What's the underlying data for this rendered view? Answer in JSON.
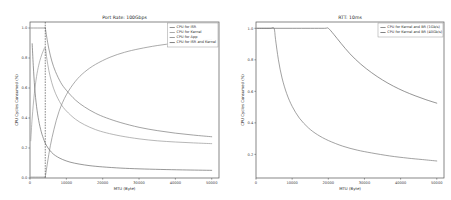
{
  "figure": {
    "background_color": "#ffffff",
    "width": 451,
    "height": 200
  },
  "chart_data": [
    {
      "id": "left",
      "type": "line",
      "title": "Port Rate: 100Gbps",
      "xlabel": "MTU (Byte)",
      "ylabel": "CPU Cycles Consumed (%)",
      "xlim": [
        0,
        52000
      ],
      "ylim": [
        0.0,
        1.04
      ],
      "xticks": [
        0,
        10000,
        20000,
        30000,
        40000,
        50000
      ],
      "xtick_labels": [
        "0",
        "10000",
        "20000",
        "30000",
        "40000",
        "50000"
      ],
      "yticks": [
        0.0,
        0.2,
        0.4,
        0.6,
        0.8,
        1.0
      ],
      "ytick_labels": [
        "0.0",
        "0.2",
        "0.4",
        "0.6",
        "0.8",
        "1.0"
      ],
      "grid": false,
      "legend_position": "upper right",
      "annotations": [
        {
          "kind": "vertical-dashed-line",
          "x": 4200,
          "label": ""
        }
      ],
      "series": [
        {
          "name": "CPU for ISR",
          "color": "#7f7f7f",
          "x": [
            200,
            1000,
            2000,
            3000,
            4000,
            4200,
            4600,
            5200,
            6000,
            7000,
            8500,
            10000,
            12500,
            15000,
            18000,
            21000,
            25000,
            30000,
            35000,
            40000,
            45000,
            50000
          ],
          "y": [
            1.0,
            1.0,
            1.0,
            1.0,
            1.0,
            1.0,
            0.94,
            0.86,
            0.78,
            0.71,
            0.635,
            0.585,
            0.52,
            0.474,
            0.432,
            0.401,
            0.369,
            0.338,
            0.316,
            0.299,
            0.286,
            0.275
          ]
        },
        {
          "name": "CPU for Kernel",
          "color": "#9a9a9a",
          "x": [
            200,
            600,
            1200,
            1800,
            2400,
            3000,
            3600,
            4200,
            4600,
            5200,
            6000,
            7000,
            8500,
            10000,
            12500,
            15000,
            18000,
            21000,
            25000,
            30000,
            35000,
            40000,
            45000,
            50000
          ],
          "y": [
            0.248,
            0.4,
            0.565,
            0.676,
            0.752,
            0.805,
            0.845,
            0.868,
            0.8,
            0.715,
            0.635,
            0.565,
            0.494,
            0.447,
            0.392,
            0.355,
            0.323,
            0.301,
            0.28,
            0.261,
            0.248,
            0.24,
            0.234,
            0.229
          ]
        },
        {
          "name": "CPU for App",
          "color": "#8a8a8a",
          "x": [
            200,
            1500,
            3000,
            4000,
            4200,
            4800,
            5600,
            6600,
            8000,
            10000,
            12500,
            15000,
            18000,
            22000,
            26000,
            30000,
            35000,
            40000,
            45000,
            50000
          ],
          "y": [
            0.006,
            0.006,
            0.006,
            0.006,
            0.008,
            0.1,
            0.215,
            0.325,
            0.445,
            0.555,
            0.645,
            0.706,
            0.757,
            0.805,
            0.838,
            0.861,
            0.883,
            0.899,
            0.912,
            0.923
          ]
        },
        {
          "name": "CPU for ISR and Kernel",
          "color": "#6f6f6f",
          "x": [
            600,
            900,
            1300,
            1800,
            2400,
            3100,
            3900,
            4600,
            5400,
            6400,
            7600,
            9000,
            11000,
            13500,
            16500,
            20000,
            25000,
            30000,
            36000,
            42000,
            50000
          ],
          "y": [
            0.895,
            0.75,
            0.6,
            0.478,
            0.383,
            0.308,
            0.25,
            0.214,
            0.186,
            0.16,
            0.14,
            0.123,
            0.106,
            0.093,
            0.082,
            0.074,
            0.066,
            0.061,
            0.057,
            0.054,
            0.051
          ]
        }
      ]
    },
    {
      "id": "right",
      "type": "line",
      "title": "RTT: 10ms",
      "xlabel": "MTU (Byte)",
      "ylabel": "CPU Cycles Consumed (%)",
      "xlim": [
        0,
        52000
      ],
      "ylim": [
        0.05,
        1.04
      ],
      "xticks": [
        0,
        10000,
        20000,
        30000,
        40000,
        50000
      ],
      "xtick_labels": [
        "0",
        "10000",
        "20000",
        "30000",
        "40000",
        "50000"
      ],
      "yticks": [
        0.2,
        0.4,
        0.6,
        0.8,
        1.0
      ],
      "ytick_labels": [
        "0.2",
        "0.4",
        "0.6",
        "0.8",
        "1.0"
      ],
      "grid": false,
      "legend_position": "upper right",
      "series": [
        {
          "name": "CPU for Kernel and BR (1Gb/s)",
          "color": "#7d7d7d",
          "x": [
            200,
            2000,
            4000,
            5000,
            5400,
            6200,
            7200,
            8500,
            10000,
            12000,
            14500,
            17000,
            20000,
            24000,
            28000,
            32000,
            37000,
            42000,
            46000,
            50000
          ],
          "y": [
            1.0,
            1.0,
            1.0,
            1.0,
            0.93,
            0.8,
            0.685,
            0.585,
            0.505,
            0.43,
            0.368,
            0.325,
            0.288,
            0.252,
            0.227,
            0.209,
            0.19,
            0.176,
            0.167,
            0.158
          ]
        },
        {
          "name": "CPU for Kernel and BR (40Gb/s)",
          "color": "#6b6b6b",
          "x": [
            200,
            5000,
            10000,
            15000,
            19000,
            20000,
            21500,
            23500,
            26000,
            29000,
            32000,
            35000,
            38000,
            41000,
            44000,
            47000,
            50000
          ],
          "y": [
            1.0,
            1.0,
            1.0,
            1.0,
            1.0,
            1.0,
            0.962,
            0.905,
            0.838,
            0.772,
            0.718,
            0.672,
            0.633,
            0.6,
            0.572,
            0.547,
            0.525
          ]
        }
      ]
    }
  ]
}
